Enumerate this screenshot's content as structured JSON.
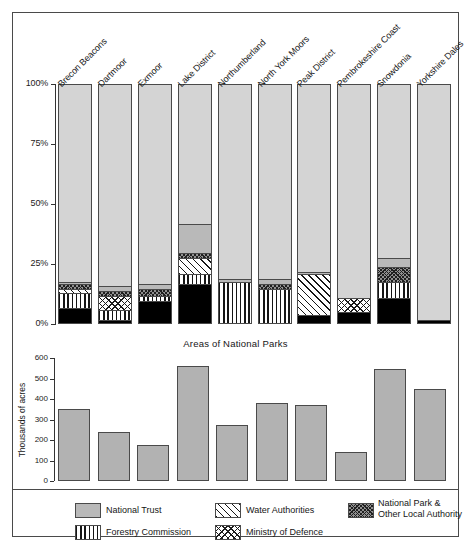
{
  "chart_data": [
    {
      "type": "bar",
      "subtype": "stacked-percent",
      "title": "Ownership of National Parks",
      "xlabel": "",
      "ylabel": "",
      "ylim": [
        0,
        100
      ],
      "yticks": [
        "0%",
        "25%",
        "50%",
        "75%",
        "100%"
      ],
      "ytick_values": [
        0,
        25,
        50,
        75,
        100
      ],
      "grid": false,
      "categories": [
        "Brecon Beacons",
        "Dartmoor",
        "Exmoor",
        "Lake District",
        "Northumberland",
        "North York Moors",
        "Peak District",
        "Pembrokeshire Coast",
        "Snowdonia",
        "Yorkshire Dales"
      ],
      "series": [
        {
          "name": "Other",
          "key": "other",
          "values": [
            6,
            1,
            9,
            16,
            0,
            0,
            3,
            4,
            10,
            1
          ]
        },
        {
          "name": "Forestry Commission",
          "key": "forestry",
          "values": [
            6,
            4,
            2,
            4,
            17,
            14,
            0,
            0,
            7,
            0
          ]
        },
        {
          "name": "Ministry of Defence",
          "key": "mod",
          "values": [
            0,
            6,
            0,
            0,
            0,
            0,
            0,
            6,
            0,
            0
          ]
        },
        {
          "name": "Water Authorities",
          "key": "water",
          "values": [
            2,
            0,
            0,
            7,
            0,
            0,
            17,
            0,
            0,
            0
          ]
        },
        {
          "name": "National Park & Other Local Authority",
          "key": "np",
          "values": [
            2,
            2,
            3,
            2,
            0,
            2,
            0,
            0,
            6,
            0
          ]
        },
        {
          "name": "National Trust",
          "key": "nt",
          "values": [
            1,
            2,
            2,
            12,
            1,
            2,
            1,
            0,
            4,
            0
          ]
        },
        {
          "name": "Private",
          "key": "private",
          "values": [
            83,
            85,
            84,
            59,
            82,
            82,
            79,
            90,
            73,
            99
          ]
        }
      ]
    },
    {
      "type": "bar",
      "title": "Areas of National Parks",
      "xlabel": "",
      "ylabel": "Thousands of acres",
      "ylim": [
        0,
        600
      ],
      "yticks": [
        "0",
        "100",
        "200",
        "300",
        "400",
        "500",
        "600"
      ],
      "ytick_values": [
        0,
        100,
        200,
        300,
        400,
        500,
        600
      ],
      "grid": false,
      "categories": [
        "Brecon Beacons",
        "Dartmoor",
        "Exmoor",
        "Lake District",
        "Northumberland",
        "North York Moors",
        "Peak District",
        "Pembrokeshire Coast",
        "Snowdonia",
        "Yorkshire Dales"
      ],
      "values": [
        350,
        240,
        175,
        560,
        275,
        380,
        370,
        140,
        545,
        450
      ]
    }
  ],
  "caption": "Areas of National Parks",
  "acres_axis_title": "Thousands of acres",
  "legend": {
    "items": [
      {
        "label": "National Trust",
        "key": "nt"
      },
      {
        "label": "Water Authorities",
        "key": "water"
      },
      {
        "label": "National Park &\nOther Local Authority",
        "key": "np",
        "line1": "National Park &",
        "line2": "Other Local Authority"
      },
      {
        "label": "Private",
        "key": "private"
      },
      {
        "label": "Forestry Commission",
        "key": "forestry"
      },
      {
        "label": "Ministry of Defence",
        "key": "mod"
      },
      {
        "label": "Other",
        "key": "other"
      }
    ]
  },
  "colors": {
    "other": "#000000",
    "private": "#d4d4d4",
    "national_trust": "#b9b9b9",
    "national_park": "#8f8f8f",
    "frame": "#4a4a4a",
    "text": "#161616"
  }
}
